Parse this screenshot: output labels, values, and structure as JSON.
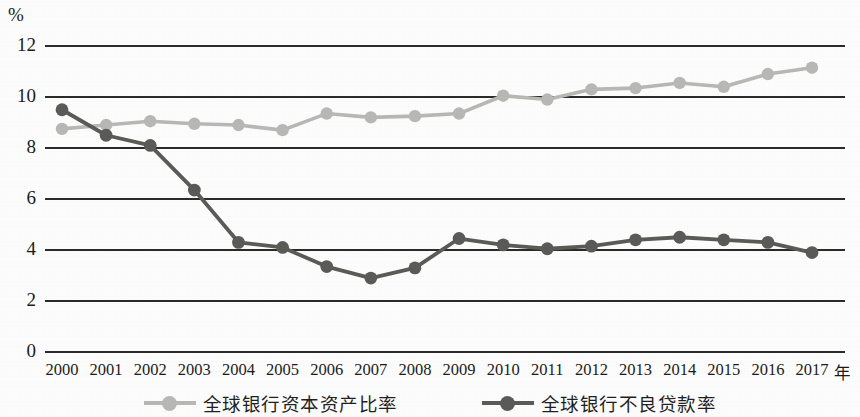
{
  "chart_data": {
    "type": "line",
    "title": "",
    "subtitle": "",
    "xlabel": "年",
    "ylabel": "%",
    "unit_label": "%",
    "x_unit_suffix": "年",
    "categories": [
      "2000",
      "2001",
      "2002",
      "2003",
      "2004",
      "2005",
      "2006",
      "2007",
      "2008",
      "2009",
      "2010",
      "2011",
      "2012",
      "2013",
      "2014",
      "2015",
      "2016",
      "2017"
    ],
    "ylim": [
      0,
      12
    ],
    "yticks": [
      "0",
      "2",
      "4",
      "6",
      "8",
      "10",
      "12"
    ],
    "ytick_values": [
      0,
      2,
      4,
      6,
      8,
      10,
      12
    ],
    "grid": "horizontal",
    "legend_position": "bottom",
    "series": [
      {
        "name": "全球银行资本资产比率",
        "color": "#b9b9b7",
        "marker": "circle",
        "values": [
          8.75,
          8.9,
          9.05,
          8.95,
          8.9,
          8.7,
          9.35,
          9.2,
          9.25,
          9.35,
          10.05,
          9.9,
          10.3,
          10.35,
          10.55,
          10.4,
          10.9,
          11.15
        ]
      },
      {
        "name": "全球银行不良贷款率",
        "color": "#5a5a58",
        "marker": "circle",
        "values": [
          9.5,
          8.5,
          8.1,
          6.35,
          4.3,
          4.1,
          3.35,
          2.9,
          3.3,
          4.45,
          4.2,
          4.05,
          4.15,
          4.4,
          4.5,
          4.4,
          4.3,
          3.9
        ]
      }
    ]
  },
  "legend": {
    "items": [
      {
        "label": "全球银行资本资产比率",
        "color": "#b9b9b7"
      },
      {
        "label": "全球银行不良贷款率",
        "color": "#5a5a58"
      }
    ]
  },
  "colors": {
    "capital_asset_ratio": "#b9b9b7",
    "npl_ratio": "#5a5a58",
    "axis": "#2a2a28",
    "background": "#ffffff"
  }
}
